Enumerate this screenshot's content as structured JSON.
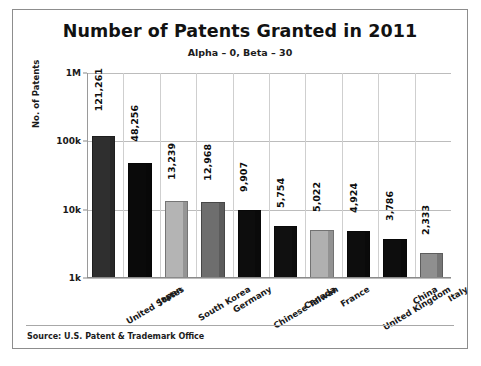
{
  "chart_data": {
    "type": "bar",
    "title": "Number of Patents Granted in 2011",
    "subtitle": "Alpha – 0, Beta – 30",
    "xlabel": "",
    "ylabel": "No. of Patents",
    "yscale": "log",
    "ylim": [
      1000,
      1000000
    ],
    "ytick_labels": [
      "1k",
      "10k",
      "100k",
      "1M"
    ],
    "ytick_values": [
      1000,
      10000,
      100000,
      1000000
    ],
    "grid": true,
    "legend": "none",
    "categories": [
      "United States",
      "Japan",
      "South Korea",
      "Germany",
      "Chinese Taiwan",
      "Canada",
      "France",
      "United Kingdom",
      "China",
      "Italy"
    ],
    "values": [
      121261,
      48256,
      13239,
      12968,
      9907,
      5754,
      5022,
      4924,
      3786,
      2333
    ],
    "value_labels": [
      "121,261",
      "48,256",
      "13,239",
      "12,968",
      "9,907",
      "5,754",
      "5,022",
      "4,924",
      "3,786",
      "2,333"
    ],
    "bar_colors": [
      "#2f2f2f",
      "#0a0a0a",
      "#b4b4b4",
      "#6e6e6e",
      "#0d0d0d",
      "#101010",
      "#b0b0b0",
      "#0d0d0d",
      "#0d0d0d",
      "#8f8f8f"
    ]
  },
  "footer": {
    "source": "Source: U.S. Patent & Trademark Office"
  },
  "colors": {
    "frame": "#8d8d8d",
    "gridline": "#bcbcbc",
    "text": "#1a1a1a",
    "background": "#ffffff"
  }
}
